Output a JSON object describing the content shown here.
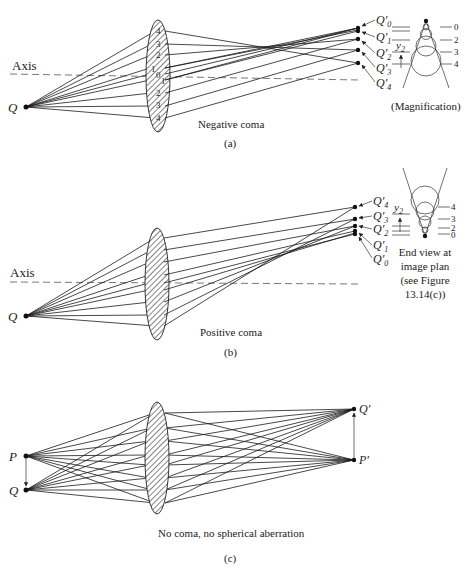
{
  "panel_a": {
    "axis_label": "Axis",
    "object_label": "Q",
    "lens_zone_labels": [
      "4",
      "3",
      "2",
      "1",
      "0",
      "1",
      "2",
      "3",
      "4"
    ],
    "image_labels": [
      "Q'0",
      "Q'1",
      "Q'2",
      "Q'3",
      "Q'4"
    ],
    "image_label_base": "Q",
    "image_label_subs": [
      "0",
      "1",
      "2",
      "3",
      "4"
    ],
    "inset_zone_labels": [
      "0",
      "2",
      "3",
      "4"
    ],
    "inset_y_label": "y",
    "inset_y_sub": "2",
    "inset_caption": "(Magnification)",
    "caption": "Negative coma",
    "panel_letter": "(a)"
  },
  "panel_b": {
    "axis_label": "Axis",
    "object_label": "Q",
    "image_label_base": "Q",
    "image_label_subs": [
      "4",
      "3",
      "2",
      "1",
      "0"
    ],
    "inset_zone_labels": [
      "4",
      "3",
      "2",
      "0"
    ],
    "inset_y_label": "y",
    "inset_y_sub": "2",
    "inset_caption_lines": [
      "End view at",
      "image plan",
      "(see Figure",
      "13.14(c))"
    ],
    "caption": "Positive coma",
    "panel_letter": "(b)"
  },
  "panel_c": {
    "object_top_label": "P",
    "object_bottom_label": "Q",
    "image_top_label": "Q'",
    "image_bottom_label": "P'",
    "caption": "No coma, no spherical aberration",
    "panel_letter": "(c)"
  }
}
